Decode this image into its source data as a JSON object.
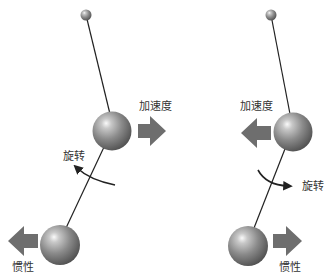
{
  "diagram": {
    "type": "double-pendulum-comparison",
    "colors": {
      "ball_dark": "#555555",
      "ball_mid": "#8a8a8a",
      "ball_highlight": "#f4f4f4",
      "arrow": "#6e6e6e",
      "rod": "#222222",
      "text": "#333333"
    },
    "left_panel": {
      "labels": {
        "acceleration": "加速度",
        "rotation": "旋转",
        "inertia": "惯性"
      },
      "acceleration_direction": "right",
      "rotation_direction": "counter-clockwise",
      "inertia_direction": "left"
    },
    "right_panel": {
      "labels": {
        "acceleration": "加速度",
        "rotation": "旋转",
        "inertia": "惯性"
      },
      "acceleration_direction": "left",
      "rotation_direction": "clockwise",
      "inertia_direction": "right"
    }
  }
}
